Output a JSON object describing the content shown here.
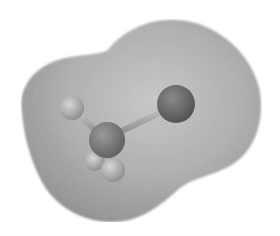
{
  "figure": {
    "molecule_description": "Tetrahedral molecule: central atom bonded to one large atom and three small atoms",
    "colors": {
      "background": "#ffffff",
      "surface_light": "#c4c4c4",
      "surface_mid": "#a8a8a8",
      "surface_dark": "#8e8e8e",
      "central_atom": "#7a7a7a",
      "large_atom": "#6a6a6a",
      "small_atom": "#b5b5b5",
      "bond": "#9a9a9a"
    },
    "atoms": [
      {
        "role": "small-atom-upper-left",
        "cx": 72,
        "cy": 108,
        "r": 12
      },
      {
        "role": "central-atom",
        "cx": 107,
        "cy": 140,
        "r": 18
      },
      {
        "role": "large-atom-right",
        "cx": 176,
        "cy": 104,
        "r": 19
      },
      {
        "role": "small-atom-lower-back",
        "cx": 95,
        "cy": 161,
        "r": 10
      },
      {
        "role": "small-atom-lower-front",
        "cx": 113,
        "cy": 170,
        "r": 12
      }
    ]
  }
}
